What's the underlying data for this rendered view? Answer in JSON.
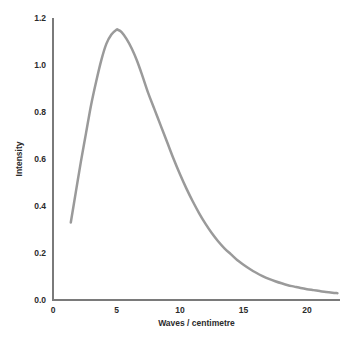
{
  "chart_data": {
    "type": "line",
    "title": "",
    "subtitle": "",
    "xlabel": "Waves / centimetre",
    "ylabel": "Intensity",
    "xlim": [
      0,
      22.6
    ],
    "ylim": [
      0.0,
      1.2
    ],
    "xticks": [
      0,
      5,
      10,
      15,
      20
    ],
    "xtick_labels": [
      "0",
      "5",
      "10",
      "15",
      "20"
    ],
    "yticks": [
      0.0,
      0.2,
      0.4,
      0.6,
      0.8,
      1.0,
      1.2
    ],
    "ytick_labels": [
      "0.0",
      "0.2",
      "0.4",
      "0.6",
      "0.8",
      "1.0",
      "1.2"
    ],
    "grid": false,
    "legend": null,
    "legend_position": "none",
    "series": [
      {
        "name": "Intensity",
        "color": "#9a9a9a",
        "line_width": 2.5,
        "x": [
          1.4,
          1.8,
          2.2,
          2.6,
          3.0,
          3.4,
          3.8,
          4.2,
          4.6,
          5.0,
          5.1,
          5.4,
          5.8,
          6.2,
          6.6,
          7.0,
          7.5,
          8.0,
          8.5,
          9.0,
          9.5,
          10.0,
          10.5,
          11.0,
          11.5,
          12.0,
          12.5,
          13.0,
          13.5,
          14.0,
          14.5,
          15.0,
          15.5,
          16.0,
          16.5,
          17.0,
          17.5,
          18.0,
          18.5,
          19.0,
          19.5,
          20.0,
          20.5,
          21.0,
          21.5,
          22.0,
          22.4
        ],
        "y": [
          0.33,
          0.46,
          0.59,
          0.71,
          0.83,
          0.93,
          1.02,
          1.09,
          1.13,
          1.15,
          1.15,
          1.14,
          1.11,
          1.07,
          1.02,
          0.96,
          0.88,
          0.81,
          0.74,
          0.67,
          0.6,
          0.535,
          0.475,
          0.42,
          0.37,
          0.325,
          0.285,
          0.25,
          0.22,
          0.195,
          0.17,
          0.15,
          0.132,
          0.116,
          0.102,
          0.09,
          0.08,
          0.071,
          0.063,
          0.057,
          0.051,
          0.046,
          0.042,
          0.038,
          0.034,
          0.031,
          0.029
        ]
      }
    ],
    "annotations": [],
    "peak": {
      "x": 5.1,
      "y": 1.15
    },
    "axis_color": "#7a7a7a",
    "text_color": "#2b2b2b",
    "background": "#ffffff"
  },
  "axes": {
    "y_title": "Intensity",
    "x_title": "Waves / centimetre"
  }
}
